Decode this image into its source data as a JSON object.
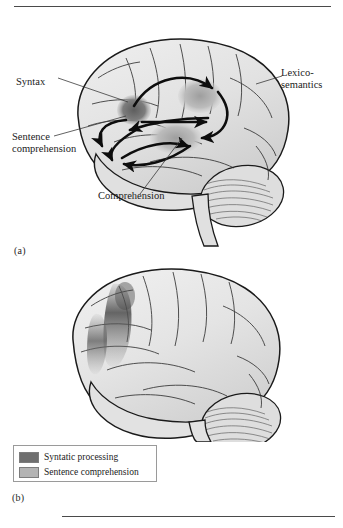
{
  "figure": {
    "type": "anatomical-diagram",
    "panels": [
      {
        "id": "a",
        "letter": "(a)",
        "description": "Brain with shaded language areas and curved arrows showing connections between frontal and posterior language regions",
        "callouts": [
          {
            "name": "syntax",
            "text": "Syntax"
          },
          {
            "name": "sentence-comprehension",
            "text": "Sentence\ncomprehension"
          },
          {
            "name": "lexico-semantics",
            "text": "Lexico-\nsemantics"
          },
          {
            "name": "comprehension",
            "text": "Comprehension"
          }
        ]
      },
      {
        "id": "b",
        "letter": "(b)",
        "description": "Brain showing shaded activation patches in the inferior frontal region without arrows"
      }
    ]
  },
  "legend": {
    "items": [
      {
        "label": "Syntatic processing",
        "color": "#6f6f6f"
      },
      {
        "label": "Sentence comprehension",
        "color": "#b4b4b4"
      }
    ]
  },
  "colors": {
    "background": "#ffffff",
    "outline": "#1a1a1a",
    "brain_fill": "#e8e8e8",
    "brain_shadow": "#c9c9c9",
    "syntactic_patch": "#6f6f6f",
    "comprehension_patch": "#b4b4b4",
    "rule": "#4a4a4a",
    "text": "#1b1b1b"
  }
}
